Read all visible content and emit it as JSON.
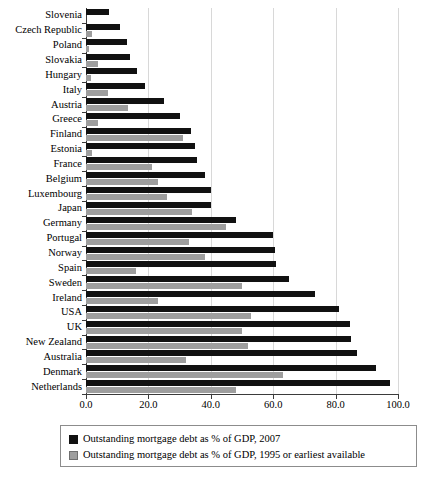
{
  "chart_data": {
    "type": "bar",
    "orientation": "horizontal",
    "title": "",
    "xlabel": "",
    "ylabel": "",
    "xlim": [
      0.0,
      100.0
    ],
    "xticks": [
      "0.0",
      "20.0",
      "40.0",
      "60.0",
      "80.0",
      "100.0"
    ],
    "grid": true,
    "legend_position": "bottom",
    "categories": [
      "Slovenia",
      "Czech Republic",
      "Poland",
      "Slovakia",
      "Hungary",
      "Italy",
      "Austria",
      "Greece",
      "Finland",
      "Estonia",
      "France",
      "Belgium",
      "Luxembourg",
      "Japan",
      "Germany",
      "Portugal",
      "Norway",
      "Spain",
      "Sweden",
      "Ireland",
      "USA",
      "UK",
      "New Zealand",
      "Australia",
      "Denmark",
      "Netherlands"
    ],
    "series": [
      {
        "name": "Outstanding mortgage debt as % of GDP, 2007",
        "color": "#111111",
        "values": [
          7.5,
          11.0,
          13.0,
          14.0,
          16.5,
          19.0,
          25.0,
          30.0,
          33.5,
          35.0,
          35.5,
          38.0,
          40.0,
          40.0,
          48.0,
          60.0,
          60.5,
          61.0,
          65.0,
          73.5,
          81.0,
          84.5,
          85.0,
          87.0,
          93.0,
          97.5
        ]
      },
      {
        "name": "Outstanding mortgage debt as % of GDP, 1995 or earliest available",
        "color": "#9e9e9e",
        "values": [
          0.0,
          2.0,
          1.0,
          4.0,
          1.5,
          7.0,
          13.5,
          4.0,
          31.0,
          2.0,
          21.0,
          23.0,
          26.0,
          34.0,
          45.0,
          33.0,
          38.0,
          16.0,
          50.0,
          23.0,
          53.0,
          50.0,
          52.0,
          32.0,
          63.0,
          48.0
        ]
      }
    ]
  },
  "legend": {
    "entries": [
      {
        "label": "Outstanding mortgage debt as % of GDP, 2007",
        "swatch": "dark"
      },
      {
        "label": "Outstanding mortgage debt as % of GDP, 1995 or earliest available",
        "swatch": "light"
      }
    ]
  }
}
